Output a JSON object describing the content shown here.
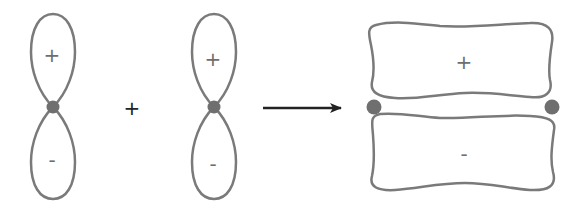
{
  "diagram": {
    "colors": {
      "outline": "#7a7a7a",
      "node": "#6f6f6f",
      "arrow": "#222222",
      "background": "#ffffff"
    },
    "orbital_left": {
      "top_lobe_sign": "+",
      "bottom_lobe_sign": "-"
    },
    "operator": "+",
    "orbital_right": {
      "top_lobe_sign": "+",
      "bottom_lobe_sign": "-"
    },
    "arrow": "reaction-arrow",
    "result": {
      "top_lobe_sign": "+",
      "bottom_lobe_sign": "-",
      "nuclei": 2
    }
  }
}
